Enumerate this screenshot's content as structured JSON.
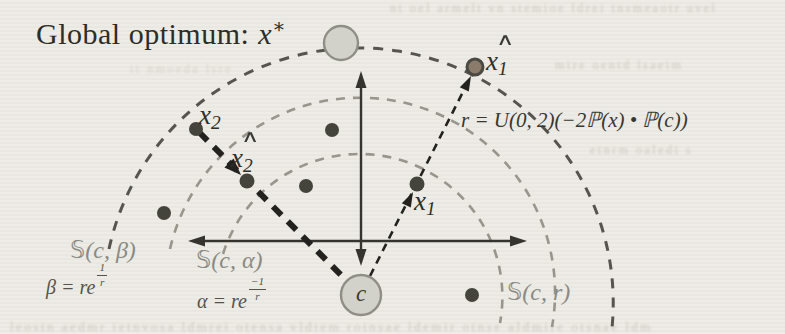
{
  "figure": {
    "title": {
      "text": "Global optimum:",
      "var": "x",
      "sup": "∗"
    },
    "radius_formula": "r = U(0, 2)(−2ℙ(x) • ℙ(c))",
    "center": {
      "label": "c"
    },
    "points": {
      "x1": {
        "base": "x",
        "sub": "1",
        "hat": ""
      },
      "x1hat": {
        "base": "x",
        "sub": "1",
        "hat": "∧"
      },
      "x2": {
        "base": "x",
        "sub": "2",
        "hat": ""
      },
      "x2hat": {
        "base": "x",
        "sub": "2",
        "hat": "∧"
      }
    },
    "spheres": {
      "beta": {
        "s": "𝕊",
        "args": "(c, β)",
        "formula_lhs": "β = re",
        "exp_num": "1",
        "exp_den": "r"
      },
      "alpha": {
        "s": "𝕊",
        "args": "(c, α)",
        "formula_lhs": "α = re",
        "exp_num": "−1",
        "exp_den": "r"
      },
      "r": {
        "s": "𝕊",
        "args": "(c, r)"
      }
    },
    "colors": {
      "paper": "#edebe5",
      "ink": "#2d2d28",
      "gray_label": "#8a8a85",
      "formula_gray": "#55534c",
      "arc_outer": "#56544e",
      "arc_inner": "#97958c",
      "axis": "#35342e",
      "trajectory": "#23221e",
      "dot": "#45443c",
      "node_fill": "#d3d2ca",
      "node_stroke": "#8f8e86"
    },
    "ghost_lines": [
      "nt oel armelt vn stemioe ldrei tnsmeaotr uvel",
      "mire oentd lsaeim",
      "etnrm oaledi s",
      "leostn aedmr ietnvosa ldmrei otensa vldiem rotnsae ldemir otnse aldmire otsnae ldm",
      "it nmoeda lsre"
    ]
  }
}
